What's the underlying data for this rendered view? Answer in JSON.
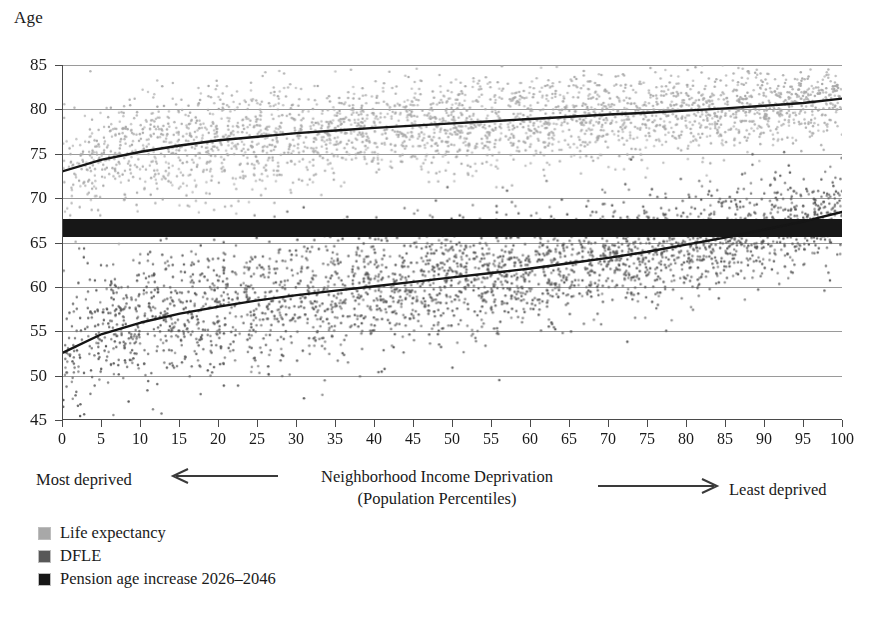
{
  "chart_data": {
    "type": "scatter",
    "title": "",
    "subtitle": "",
    "xlabel": "Neighborhood Income Deprivation",
    "xlabel_line2": "(Population Percentiles)",
    "ylabel": "Age",
    "xlim": [
      0,
      100
    ],
    "ylim": [
      45,
      85
    ],
    "grid": true,
    "grid_axis": "y",
    "legend_position": "below-axis-left",
    "x_left_annotation": "Most deprived",
    "x_right_annotation": "Least deprived",
    "xticks": [
      0,
      5,
      10,
      15,
      20,
      25,
      30,
      35,
      40,
      45,
      50,
      55,
      60,
      65,
      70,
      75,
      80,
      85,
      90,
      95,
      100
    ],
    "yticks": [
      45,
      50,
      55,
      60,
      65,
      70,
      75,
      80,
      85
    ],
    "xtick_labels": [
      "0",
      "5",
      "10",
      "15",
      "20",
      "25",
      "30",
      "35",
      "40",
      "45",
      "50",
      "55",
      "60",
      "65",
      "70",
      "75",
      "80",
      "85",
      "90",
      "95",
      "100"
    ],
    "ytick_labels": [
      "45",
      "50",
      "55",
      "60",
      "65",
      "70",
      "75",
      "80",
      "85"
    ],
    "series": [
      {
        "name": "Life expectancy",
        "kind": "scatter+fit",
        "color": "#a8a8a8",
        "fit_color": "#151515",
        "point_count": 2800,
        "scatter_spread": 2.6,
        "fit_x": [
          0,
          5,
          10,
          15,
          20,
          25,
          30,
          35,
          40,
          45,
          50,
          55,
          60,
          65,
          70,
          75,
          80,
          85,
          90,
          95,
          100
        ],
        "fit_y": [
          73.0,
          74.3,
          75.2,
          75.9,
          76.5,
          76.9,
          77.3,
          77.6,
          77.9,
          78.15,
          78.4,
          78.65,
          78.9,
          79.15,
          79.4,
          79.6,
          79.85,
          80.1,
          80.4,
          80.7,
          81.2
        ]
      },
      {
        "name": "DFLE",
        "kind": "scatter+fit",
        "color": "#585858",
        "fit_color": "#151515",
        "point_count": 3000,
        "scatter_spread": 3.3,
        "fit_x": [
          0,
          5,
          10,
          15,
          20,
          25,
          30,
          35,
          40,
          45,
          50,
          55,
          60,
          65,
          70,
          75,
          80,
          85,
          90,
          95,
          100
        ],
        "fit_y": [
          52.5,
          54.6,
          55.9,
          56.9,
          57.7,
          58.4,
          59.0,
          59.5,
          60.0,
          60.5,
          61.0,
          61.5,
          62.0,
          62.6,
          63.2,
          63.9,
          64.7,
          65.5,
          66.4,
          67.3,
          68.4
        ]
      },
      {
        "name": "Pension age increase 2026–2046",
        "kind": "band",
        "color": "#171717",
        "band_low": 65.6,
        "band_high": 67.6
      }
    ]
  },
  "axis": {
    "y_title": "Age"
  },
  "caption": {
    "most_deprived": "Most deprived",
    "least_deprived": "Least deprived",
    "center_line1": "Neighborhood Income Deprivation",
    "center_line2": "(Population Percentiles)"
  },
  "legend": {
    "items": [
      {
        "label": "Life expectancy",
        "color": "#a8a8a8"
      },
      {
        "label": "DFLE",
        "color": "#585858"
      },
      {
        "label": "Pension age increase 2026–2046",
        "color": "#171717"
      }
    ]
  }
}
